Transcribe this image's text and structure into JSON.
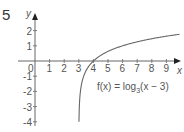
{
  "question_number": "5",
  "chart_data": {
    "type": "line",
    "title": "",
    "function_label": "f(x) = log3(x - 3)",
    "function_label_parts": {
      "prefix": "f(x) = log",
      "base": "3",
      "suffix": "(x − 3)"
    },
    "xlabel": "x",
    "ylabel": "y",
    "xlim": [
      0,
      9.9
    ],
    "ylim": [
      -4,
      2.4
    ],
    "x_ticks": [
      "0",
      "1",
      "2",
      "3",
      "4",
      "5",
      "6",
      "7",
      "8",
      "9"
    ],
    "y_ticks": [
      "2",
      "1",
      "-1",
      "-2",
      "-3",
      "-4"
    ],
    "grid": false,
    "series": [
      {
        "name": "f(x) = log3(x - 3)",
        "x": [
          3.012,
          3.037,
          3.111,
          3.333,
          3.5,
          4,
          4.5,
          5,
          6,
          7,
          8,
          9,
          9.9
        ],
        "y": [
          -4,
          -3,
          -2,
          -1,
          -0.63,
          0,
          0.37,
          0.63,
          1,
          1.26,
          1.46,
          1.63,
          1.76
        ]
      }
    ],
    "color": "#666666"
  }
}
